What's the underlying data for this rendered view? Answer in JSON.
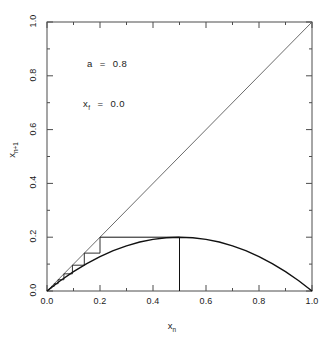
{
  "figure": {
    "title": "",
    "background_color": "#ffffff",
    "frame_color": "#4d4d4d"
  },
  "annotations": {
    "parameter_a": "a  =  0.8",
    "fixed_point": "xf  =  0.0",
    "parameter_a_symbol": "a",
    "parameter_a_value": "0.8",
    "fixed_point_symbol": "x",
    "fixed_point_subscript": "f",
    "fixed_point_value": "0.0",
    "equals": "="
  },
  "axes": {
    "x_label_base": "x",
    "x_label_sub": "n",
    "y_label_base": "x",
    "y_label_sub": "n+1",
    "x_ticks": [
      "0.0",
      "0.2",
      "0.4",
      "0.6",
      "0.8",
      "1.0"
    ],
    "y_ticks": [
      "0.0",
      "0.2",
      "0.4",
      "0.6",
      "0.8",
      "1.0"
    ]
  },
  "chart_data": {
    "type": "line",
    "title": "",
    "xlabel": "x_n",
    "ylabel": "x_{n+1}",
    "xlim": [
      0.0,
      1.0
    ],
    "ylim": [
      0.0,
      1.0
    ],
    "grid": false,
    "legend": "none",
    "x_ticks": [
      0.0,
      0.2,
      0.4,
      0.6,
      0.8,
      1.0
    ],
    "y_ticks": [
      0.0,
      0.2,
      0.4,
      0.6,
      0.8,
      1.0
    ],
    "x_minor_ticks": [
      0.1,
      0.3,
      0.5,
      0.7,
      0.9
    ],
    "y_minor_ticks": [
      0.1,
      0.3,
      0.5,
      0.7,
      0.9
    ],
    "parameters": {
      "a": 0.8,
      "x_f": 0.0,
      "x0": 0.2,
      "map": "f(x) = 4*a*x*(1-x)",
      "peak_value": 0.2,
      "peak_x": 0.5
    },
    "series": [
      {
        "name": "map-curve",
        "type": "line",
        "comment": "logistic map f(x)=4*0.8*x*(1-x), sampled at x=0..1 step 0.05",
        "x": [
          0.0,
          0.05,
          0.1,
          0.15,
          0.2,
          0.25,
          0.3,
          0.35,
          0.4,
          0.45,
          0.5,
          0.55,
          0.6,
          0.65,
          0.7,
          0.75,
          0.8,
          0.85,
          0.9,
          0.95,
          1.0
        ],
        "y": [
          0.0,
          0.0152,
          0.0288,
          0.0408,
          0.0512,
          0.06,
          0.0672,
          0.0728,
          0.0768,
          0.0792,
          0.08,
          0.0792,
          0.0768,
          0.0728,
          0.0672,
          0.06,
          0.0512,
          0.0408,
          0.0288,
          0.0152,
          0.0
        ],
        "y_scaled": [
          0.0,
          0.152,
          0.288,
          0.408,
          0.512,
          0.6,
          0.672,
          0.728,
          0.768,
          0.792,
          0.8,
          0.792,
          0.768,
          0.728,
          0.672,
          0.6,
          0.512,
          0.408,
          0.288,
          0.152,
          0.0
        ]
      },
      {
        "name": "identity-line",
        "type": "line",
        "x": [
          0.0,
          1.0
        ],
        "y": [
          0.0,
          1.0
        ]
      },
      {
        "name": "cobweb-staircase",
        "type": "line",
        "comment": "iteration x_{n+1}=3.2 x_n (1-x_n) starting x0=0.2, vertical then horizontal segments",
        "points": [
          [
            0.2,
            0.2
          ],
          [
            0.2,
            0.1408
          ],
          [
            0.1408,
            0.1408
          ],
          [
            0.1408,
            0.0959
          ],
          [
            0.0959,
            0.0959
          ],
          [
            0.0959,
            0.0638
          ],
          [
            0.0638,
            0.0638
          ],
          [
            0.0638,
            0.0419
          ],
          [
            0.0419,
            0.0419
          ],
          [
            0.0419,
            0.0271
          ],
          [
            0.0271,
            0.0271
          ],
          [
            0.0271,
            0.0174
          ],
          [
            0.0174,
            0.0174
          ],
          [
            0.0174,
            0.0111
          ],
          [
            0.0111,
            0.0111
          ],
          [
            0.0111,
            0.007
          ],
          [
            0.007,
            0.007
          ],
          [
            0.007,
            0.0044
          ],
          [
            0.0044,
            0.0044
          ],
          [
            0.0044,
            0.0028
          ],
          [
            0.0028,
            0.0028
          ],
          [
            0.0028,
            0.0018
          ],
          [
            0.0018,
            0.0018
          ],
          [
            0.0018,
            0.0011
          ],
          [
            0.0011,
            0.0011
          ],
          [
            0.0011,
            0.0007
          ],
          [
            0.0007,
            0.0007
          ],
          [
            0.0,
            0.0
          ]
        ]
      },
      {
        "name": "peak-marker-line",
        "type": "line",
        "comment": "vertical drop from curve maximum to x-axis",
        "x": [
          0.5,
          0.5
        ],
        "y": [
          0.2,
          0.0
        ]
      },
      {
        "name": "peak-horizontal-line",
        "type": "line",
        "comment": "horizontal segment at y=0.2 from x=0.2 to the peak at x=0.5",
        "x": [
          0.2,
          0.5
        ],
        "y": [
          0.2,
          0.2
        ]
      }
    ]
  }
}
